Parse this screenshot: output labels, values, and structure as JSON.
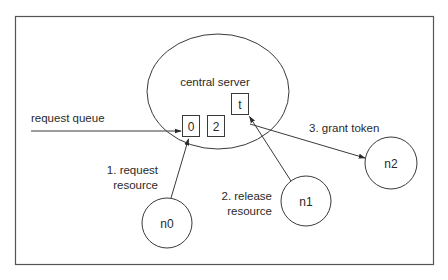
{
  "diagram": {
    "type": "token-based mutual exclusion (central server)",
    "colors": {
      "stroke": "#3a3a3a",
      "frame": "#555555",
      "text": "#2a2a2a",
      "background": "#ffffff"
    },
    "server": {
      "label": "central server",
      "queue_slots": [
        "0",
        "2"
      ],
      "token": "t"
    },
    "queue": {
      "label": "request queue"
    },
    "nodes": [
      {
        "id": "n0",
        "label": "n0"
      },
      {
        "id": "n1",
        "label": "n1"
      },
      {
        "id": "n2",
        "label": "n2"
      }
    ],
    "edges": [
      {
        "from": "n0",
        "to": "server-queue",
        "label_line1": "1. request",
        "label_line2": "resource"
      },
      {
        "from": "n1",
        "to": "server-token",
        "label_line1": "2. release",
        "label_line2": "resource"
      },
      {
        "from": "server-token",
        "to": "n2",
        "label_line1": "3. grant token"
      }
    ]
  }
}
